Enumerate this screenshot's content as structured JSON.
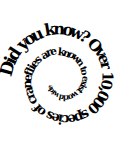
{
  "image": {
    "width": 129,
    "height": 145,
    "background_color": "#ffffff",
    "text_color": "#000000"
  },
  "graphic": {
    "type": "spiral-text",
    "full_text": "Did you know? Over 10,000 species of craneflies are known to exist world wide",
    "direction": "clockwise-inward",
    "font_weight": "bold",
    "font_style": "serif",
    "segments": [
      "Did",
      "you",
      "know?",
      "Over",
      "10,000",
      "species",
      "of",
      "craneflies",
      "are",
      "known",
      "to",
      "exist",
      "world",
      "wide"
    ],
    "headline": "Did you know?",
    "fact": "Over 10,000 species of craneflies are known to exist world wide",
    "number_mentioned": "10,000",
    "subject": "craneflies",
    "center": {
      "x": 62,
      "y": 80
    },
    "start_radius": 58,
    "end_radius": 14,
    "start_angle_deg": 186,
    "total_sweep_deg": 690,
    "start_font_size": 17.5,
    "end_font_size": 6.5
  }
}
